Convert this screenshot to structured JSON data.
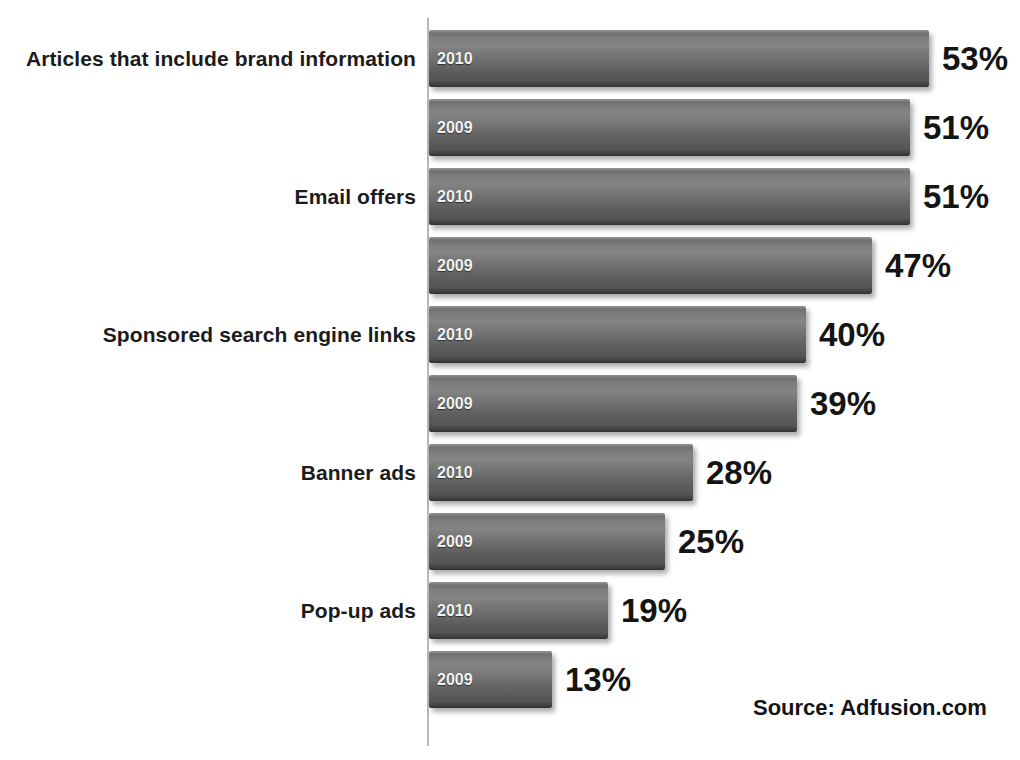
{
  "chart_data": {
    "type": "bar",
    "orientation": "horizontal",
    "title": "",
    "xlabel": "",
    "ylabel": "",
    "grid": false,
    "legend": "none",
    "axis_visible": true,
    "value_suffix": "%",
    "xlim": [
      0,
      53
    ],
    "series": [
      {
        "name": "2010",
        "values": [
          53,
          51,
          40,
          28,
          19
        ]
      },
      {
        "name": "2009",
        "values": [
          51,
          47,
          39,
          25,
          13
        ]
      }
    ],
    "categories": [
      "Articles that include brand information",
      "Email offers",
      "Sponsored search engine links",
      "Banner ads",
      "Pop-up ads"
    ],
    "bars": [
      {
        "category": "Articles that include brand information",
        "year": "2010",
        "value": 53,
        "value_label": "53%"
      },
      {
        "category": "Articles that include brand information",
        "year": "2009",
        "value": 51,
        "value_label": "51%"
      },
      {
        "category": "Email offers",
        "year": "2010",
        "value": 51,
        "value_label": "51%"
      },
      {
        "category": "Email offers",
        "year": "2009",
        "value": 47,
        "value_label": "47%"
      },
      {
        "category": "Sponsored search engine links",
        "year": "2010",
        "value": 40,
        "value_label": "40%"
      },
      {
        "category": "Sponsored search engine links",
        "year": "2009",
        "value": 39,
        "value_label": "39%"
      },
      {
        "category": "Banner ads",
        "year": "2010",
        "value": 28,
        "value_label": "28%"
      },
      {
        "category": "Banner ads",
        "year": "2009",
        "value": 25,
        "value_label": "25%"
      },
      {
        "category": "Pop-up ads",
        "year": "2010",
        "value": 19,
        "value_label": "19%"
      },
      {
        "category": "Pop-up ads",
        "year": "2009",
        "value": 13,
        "value_label": "13%"
      }
    ],
    "annotations": [
      {
        "name": "source",
        "text": "Source: Adfusion.com"
      }
    ],
    "colors": {
      "bar_fill_light": "#848484",
      "bar_fill_dark": "#2f2f2f",
      "background": "#ffffff",
      "text": "#141414",
      "year_label": "#f2f2f2",
      "axis_line": "#b8b8b8"
    }
  },
  "source": {
    "text": "Source: Adfusion.com"
  }
}
